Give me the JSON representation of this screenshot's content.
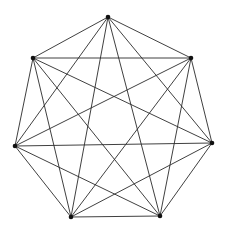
{
  "diagram": {
    "type": "complete-graph",
    "name": "K7",
    "vertex_count": 7,
    "colors": {
      "edge": "#2a2a2a",
      "vertex": "#111111",
      "background": "#ffffff"
    },
    "vertices": [
      {
        "id": "v0",
        "x": 108,
        "y": 17
      },
      {
        "id": "v1",
        "x": 191,
        "y": 58
      },
      {
        "id": "v2",
        "x": 212,
        "y": 143
      },
      {
        "id": "v3",
        "x": 160,
        "y": 216
      },
      {
        "id": "v4",
        "x": 71,
        "y": 217
      },
      {
        "id": "v5",
        "x": 15,
        "y": 146
      },
      {
        "id": "v6",
        "x": 33,
        "y": 58
      }
    ]
  }
}
